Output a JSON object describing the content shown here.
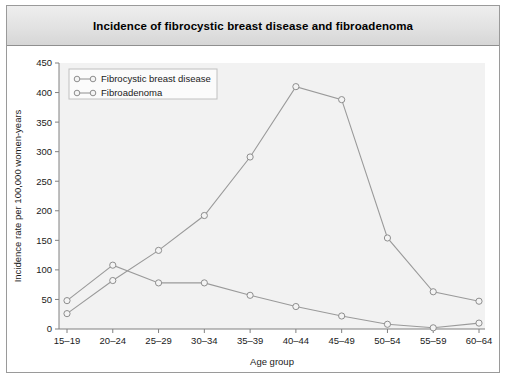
{
  "figure": {
    "title": "Incidence of fibrocystic breast disease and fibroadenoma"
  },
  "colors": {
    "series_line": "#9a9a9a",
    "marker_fill": "#f4f4f4",
    "marker_stroke": "#8e8e8e",
    "axis": "#808080",
    "plot_background": "#f2f2f2",
    "title_bar_background": "#e2e2e2",
    "frame_border": "#9a9a9a",
    "text": "#1a1a1a"
  },
  "legend": {
    "position": "top-left-inside",
    "entries": [
      {
        "label": "Fibrocystic breast disease",
        "marker": "open-circle"
      },
      {
        "label": "Fibroadenoma",
        "marker": "open-circle"
      }
    ]
  },
  "axes": {
    "y_ticks": [
      "0",
      "50",
      "100",
      "150",
      "200",
      "250",
      "300",
      "350",
      "400",
      "450"
    ],
    "x_ticks": [
      "15–19",
      "20–24",
      "25–29",
      "30–34",
      "35–39",
      "40–44",
      "45–49",
      "50–54",
      "55–59",
      "60–64"
    ]
  },
  "chart_data": {
    "type": "line",
    "title": "Incidence of fibrocystic breast disease and fibroadenoma",
    "xlabel": "Age group",
    "ylabel": "Incidence rate per 100,000 women-years",
    "categories": [
      "15–19",
      "20–24",
      "25–29",
      "30–34",
      "35–39",
      "40–44",
      "45–49",
      "50–54",
      "55–59",
      "60–64"
    ],
    "series": [
      {
        "name": "Fibrocystic breast disease",
        "values": [
          26,
          82,
          133,
          192,
          291,
          410,
          388,
          154,
          63,
          47
        ]
      },
      {
        "name": "Fibroadenoma",
        "values": [
          48,
          108,
          78,
          78,
          57,
          38,
          22,
          8,
          2,
          10
        ]
      }
    ],
    "ylim": [
      0,
      450
    ],
    "ytick_step": 50,
    "grid": false,
    "legend": "inside top-left"
  }
}
